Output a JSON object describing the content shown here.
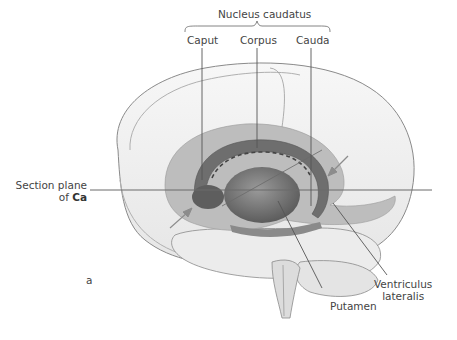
{
  "figure": {
    "panel_letter": "a",
    "group_label": "Nucleus caudatus",
    "labels": {
      "caput": "Caput",
      "corpus": "Corpus",
      "cauda": "Cauda",
      "section_plane_line1": "Section plane",
      "section_plane_line2_prefix": "of ",
      "section_plane_line2_bold": "Ca",
      "putamen": "Putamen",
      "ventriculus_line1": "Ventriculus",
      "ventriculus_line2": "lateralis"
    },
    "colors": {
      "line": "#555555",
      "brain_fill": "#f3f3f3",
      "brain_outline": "#8a8a8a",
      "structure_dark": "#6e6e6e",
      "structure_mid": "#9a9a9a",
      "structure_light": "#bdbdbd",
      "arrow": "#8c8c8c",
      "text": "#444444"
    }
  }
}
